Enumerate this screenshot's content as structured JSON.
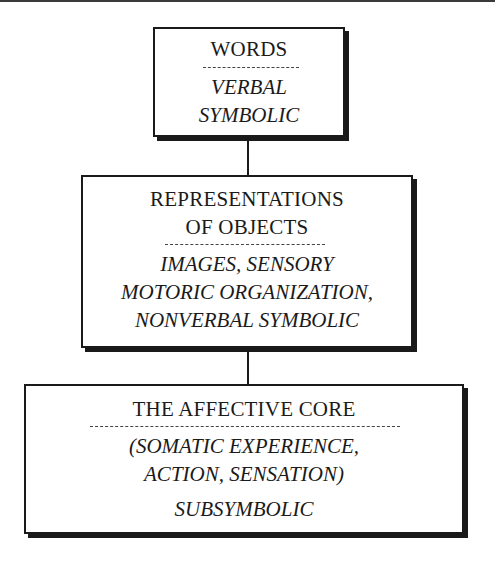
{
  "diagram": {
    "boxes": [
      {
        "id": "words",
        "heading": [
          "WORDS"
        ],
        "detail": [
          "VERBAL",
          "SYMBOLIC"
        ]
      },
      {
        "id": "representations",
        "heading": [
          "REPRESENTATIONS",
          "OF OBJECTS"
        ],
        "detail": [
          "IMAGES, SENSORY",
          "MOTORIC ORGANIZATION,",
          "NONVERBAL SYMBOLIC"
        ]
      },
      {
        "id": "affective-core",
        "heading": [
          "THE AFFECTIVE CORE"
        ],
        "detail": [
          "(SOMATIC EXPERIENCE,",
          "ACTION, SENSATION)",
          "SUBSYMBOLIC"
        ]
      }
    ],
    "connectors": [
      {
        "from": "words",
        "to": "representations"
      },
      {
        "from": "representations",
        "to": "affective-core"
      }
    ],
    "colors": {
      "ink": "#1a1a1a",
      "background": "#ffffff"
    }
  }
}
